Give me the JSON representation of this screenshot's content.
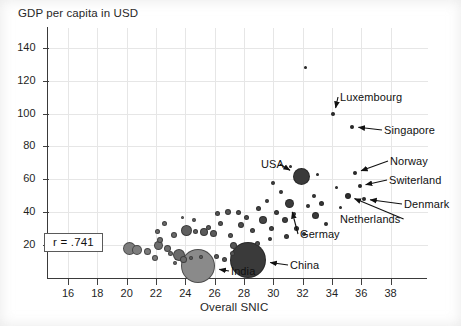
{
  "figure": {
    "y_axis_title": "GDP per capita in USD",
    "x_axis_title": "Overall SNIC",
    "stat_label": "r = .741"
  },
  "chart_data": {
    "type": "scatter",
    "title": "",
    "subtitle": "",
    "xlabel": "Overall SNIC",
    "ylabel": "GDP per capita in USD",
    "xlim": [
      14.6,
      39.6
    ],
    "ylim": [
      0,
      152
    ],
    "xticks": [
      16,
      18,
      20,
      22,
      24,
      26,
      28,
      30,
      32,
      34,
      36,
      38
    ],
    "yticks": [
      20,
      40,
      60,
      80,
      100,
      120,
      140
    ],
    "grid": true,
    "legend": null,
    "annotation": "r = .741",
    "correlation": 0.741,
    "bubble_size_encodes": "population",
    "points": [
      {
        "label": "India",
        "x": 24.9,
        "y": 7,
        "size": 34,
        "color": "#8a8a8a"
      },
      {
        "label": "China",
        "x": 28.3,
        "y": 11,
        "size": 36,
        "color": "#3a3a3a"
      },
      {
        "label": "USA",
        "x": 31.9,
        "y": 62,
        "size": 17,
        "color": "#3a3a3a"
      },
      {
        "label": "Germay",
        "x": 31.1,
        "y": 45,
        "size": 9,
        "color": "#3a3a3a"
      },
      {
        "label": "Netherlands",
        "x": 35.1,
        "y": 50,
        "size": 6,
        "color": "#2e2e2e"
      },
      {
        "label": "Denmark",
        "x": 36.2,
        "y": 48,
        "size": 4,
        "color": "#2e2e2e"
      },
      {
        "label": "Switerland",
        "x": 35.9,
        "y": 56,
        "size": 4,
        "color": "#2e2e2e"
      },
      {
        "label": "Norway",
        "x": 35.6,
        "y": 64,
        "size": 4,
        "color": "#2e2e2e"
      },
      {
        "label": "Singapore",
        "x": 35.4,
        "y": 92,
        "size": 4,
        "color": "#2e2e2e"
      },
      {
        "label": "Luxembourg",
        "x": 34.1,
        "y": 100,
        "size": 4,
        "color": "#2e2e2e"
      },
      {
        "label": "",
        "x": 32.2,
        "y": 128,
        "size": 3,
        "color": "#2e2e2e"
      },
      {
        "label": "",
        "x": 20.2,
        "y": 18,
        "size": 13,
        "color": "#7d7d7d"
      },
      {
        "label": "",
        "x": 20.7,
        "y": 17,
        "size": 10,
        "color": "#7d7d7d"
      },
      {
        "label": "",
        "x": 21.4,
        "y": 16,
        "size": 7,
        "color": "#7a7a7a"
      },
      {
        "label": "",
        "x": 21.9,
        "y": 12,
        "size": 6,
        "color": "#7a7a7a"
      },
      {
        "label": "",
        "x": 22.2,
        "y": 20,
        "size": 9,
        "color": "#6e6e6e"
      },
      {
        "label": "",
        "x": 22.3,
        "y": 23,
        "size": 6,
        "color": "#6e6e6e"
      },
      {
        "label": "",
        "x": 22.1,
        "y": 28,
        "size": 5,
        "color": "#6a6a6a"
      },
      {
        "label": "",
        "x": 22.6,
        "y": 33,
        "size": 5,
        "color": "#6a6a6a"
      },
      {
        "label": "",
        "x": 22.8,
        "y": 18,
        "size": 7,
        "color": "#6e6e6e"
      },
      {
        "label": "",
        "x": 23.0,
        "y": 15,
        "size": 5,
        "color": "#6e6e6e"
      },
      {
        "label": "",
        "x": 23.2,
        "y": 26,
        "size": 6,
        "color": "#6a6a6a"
      },
      {
        "label": "",
        "x": 23.6,
        "y": 14,
        "size": 12,
        "color": "#6a6a6a"
      },
      {
        "label": "",
        "x": 23.9,
        "y": 11,
        "size": 7,
        "color": "#6a6a6a"
      },
      {
        "label": "",
        "x": 24.1,
        "y": 29,
        "size": 11,
        "color": "#5f5f5f"
      },
      {
        "label": "",
        "x": 24.7,
        "y": 28,
        "size": 5,
        "color": "#5f5f5f"
      },
      {
        "label": "",
        "x": 25.3,
        "y": 28,
        "size": 8,
        "color": "#5a5a5a"
      },
      {
        "label": "",
        "x": 25.6,
        "y": 31,
        "size": 5,
        "color": "#5a5a5a"
      },
      {
        "label": "",
        "x": 25.9,
        "y": 27,
        "size": 7,
        "color": "#5a5a5a"
      },
      {
        "label": "",
        "x": 26.4,
        "y": 33,
        "size": 5,
        "color": "#555"
      },
      {
        "label": "",
        "x": 26.9,
        "y": 40,
        "size": 6,
        "color": "#555"
      },
      {
        "label": "",
        "x": 27.1,
        "y": 26,
        "size": 5,
        "color": "#555"
      },
      {
        "label": "",
        "x": 27.3,
        "y": 20,
        "size": 7,
        "color": "#555"
      },
      {
        "label": "",
        "x": 27.2,
        "y": 15,
        "size": 5,
        "color": "#555"
      },
      {
        "label": "",
        "x": 26.1,
        "y": 13,
        "size": 5,
        "color": "#5a5a5a"
      },
      {
        "label": "",
        "x": 25.1,
        "y": 13,
        "size": 4,
        "color": "#5f5f5f"
      },
      {
        "label": "",
        "x": 24.4,
        "y": 12,
        "size": 4,
        "color": "#5f5f5f"
      },
      {
        "label": "",
        "x": 23.3,
        "y": 9,
        "size": 4,
        "color": "#6a6a6a"
      },
      {
        "label": "",
        "x": 26.7,
        "y": 11,
        "size": 5,
        "color": "#555"
      },
      {
        "label": "",
        "x": 27.8,
        "y": 32,
        "size": 6,
        "color": "#4d4d4d"
      },
      {
        "label": "",
        "x": 28.2,
        "y": 37,
        "size": 5,
        "color": "#4d4d4d"
      },
      {
        "label": "",
        "x": 28.6,
        "y": 29,
        "size": 5,
        "color": "#4d4d4d"
      },
      {
        "label": "",
        "x": 29.0,
        "y": 42,
        "size": 5,
        "color": "#444"
      },
      {
        "label": "",
        "x": 29.3,
        "y": 35,
        "size": 8,
        "color": "#444"
      },
      {
        "label": "",
        "x": 29.6,
        "y": 47,
        "size": 4,
        "color": "#444"
      },
      {
        "label": "",
        "x": 29.9,
        "y": 30,
        "size": 5,
        "color": "#444"
      },
      {
        "label": "",
        "x": 30.2,
        "y": 40,
        "size": 5,
        "color": "#3f3f3f"
      },
      {
        "label": "",
        "x": 30.5,
        "y": 52,
        "size": 4,
        "color": "#3f3f3f"
      },
      {
        "label": "",
        "x": 30.8,
        "y": 35,
        "size": 6,
        "color": "#3f3f3f"
      },
      {
        "label": "",
        "x": 31.4,
        "y": 39,
        "size": 4,
        "color": "#3a3a3a"
      },
      {
        "label": "",
        "x": 31.6,
        "y": 30,
        "size": 5,
        "color": "#3a3a3a"
      },
      {
        "label": "",
        "x": 32.4,
        "y": 44,
        "size": 4,
        "color": "#3a3a3a"
      },
      {
        "label": "",
        "x": 32.8,
        "y": 50,
        "size": 4,
        "color": "#3a3a3a"
      },
      {
        "label": "",
        "x": 32.9,
        "y": 38,
        "size": 7,
        "color": "#3a3a3a"
      },
      {
        "label": "",
        "x": 33.3,
        "y": 45,
        "size": 5,
        "color": "#363636"
      },
      {
        "label": "",
        "x": 33.6,
        "y": 33,
        "size": 4,
        "color": "#363636"
      },
      {
        "label": "",
        "x": 30.0,
        "y": 58,
        "size": 4,
        "color": "#3f3f3f"
      },
      {
        "label": "",
        "x": 31.2,
        "y": 68,
        "size": 3,
        "color": "#3a3a3a"
      },
      {
        "label": "",
        "x": 33.0,
        "y": 63,
        "size": 3,
        "color": "#363636"
      },
      {
        "label": "",
        "x": 28.9,
        "y": 21,
        "size": 5,
        "color": "#4d4d4d"
      },
      {
        "label": "",
        "x": 29.8,
        "y": 24,
        "size": 4,
        "color": "#444"
      },
      {
        "label": "",
        "x": 30.9,
        "y": 25,
        "size": 5,
        "color": "#3f3f3f"
      },
      {
        "label": "",
        "x": 32.1,
        "y": 27,
        "size": 4,
        "color": "#3a3a3a"
      },
      {
        "label": "",
        "x": 24.6,
        "y": 35,
        "size": 4,
        "color": "#5f5f5f"
      },
      {
        "label": "",
        "x": 23.8,
        "y": 37,
        "size": 3,
        "color": "#6a6a6a"
      },
      {
        "label": "",
        "x": 26.2,
        "y": 39,
        "size": 5,
        "color": "#555"
      },
      {
        "label": "",
        "x": 27.6,
        "y": 40,
        "size": 5,
        "color": "#4d4d4d"
      },
      {
        "label": "",
        "x": 34.3,
        "y": 55,
        "size": 3,
        "color": "#363636"
      },
      {
        "label": "",
        "x": 34.6,
        "y": 43,
        "size": 3,
        "color": "#363636"
      }
    ],
    "callouts": [
      {
        "label": "Luxembourg",
        "text_x": 340,
        "text_y": 91,
        "anchor": "start"
      },
      {
        "label": "Singapore",
        "text_x": 384,
        "text_y": 124,
        "anchor": "start"
      },
      {
        "label": "Norway",
        "text_x": 390,
        "text_y": 155,
        "anchor": "start"
      },
      {
        "label": "Switerland",
        "text_x": 389,
        "text_y": 174,
        "anchor": "start"
      },
      {
        "label": "Denmark",
        "text_x": 404,
        "text_y": 198,
        "anchor": "start"
      },
      {
        "label": "Netherlands",
        "text_x": 340,
        "text_y": 213,
        "anchor": "start"
      },
      {
        "label": "USA",
        "text_x": 261,
        "text_y": 158,
        "anchor": "start"
      },
      {
        "label": "Germay",
        "text_x": 300,
        "text_y": 228,
        "anchor": "start"
      },
      {
        "label": "China",
        "text_x": 290,
        "text_y": 259,
        "anchor": "start"
      },
      {
        "label": "India",
        "text_x": 231,
        "text_y": 265,
        "anchor": "start"
      }
    ]
  }
}
